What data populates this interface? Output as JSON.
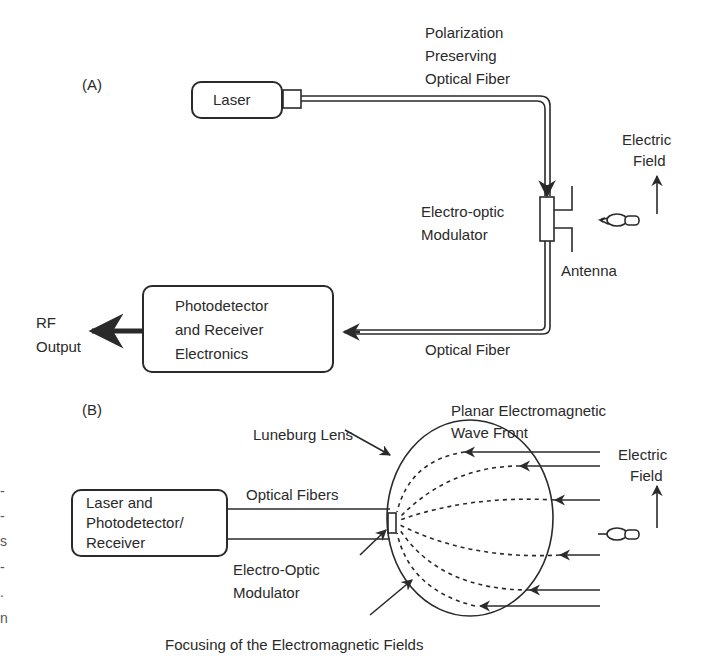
{
  "panel_a": {
    "label": "(A)",
    "laser": "Laser",
    "fiber_top": [
      "Polarization",
      "Preserving",
      "Optical Fiber"
    ],
    "modulator": [
      "Electro-optic",
      "Modulator"
    ],
    "antenna": "Antenna",
    "electric_field": [
      "Electric",
      "Field"
    ],
    "receiver": [
      "Photodetector",
      "and Receiver",
      "Electronics"
    ],
    "rf_output": [
      "RF",
      "Output"
    ],
    "fiber_bottom": "Optical Fiber"
  },
  "panel_b": {
    "label": "(B)",
    "luneburg": "Luneburg Lens",
    "wavefront": [
      "Planar Electromagnetic",
      "Wave Front"
    ],
    "electric_field": [
      "Electric",
      "Field"
    ],
    "transceiver": [
      "Laser and",
      "Photodetector/",
      "Receiver"
    ],
    "fibers": "Optical Fibers",
    "modulator": [
      "Electro-Optic",
      "Modulator"
    ],
    "focusing": "Focusing of the Electromagnetic Fields"
  },
  "clipped_left_fragments": [
    "-",
    "-",
    "s",
    "-",
    ".",
    "n"
  ],
  "colors": {
    "ink": "#2a2a2a",
    "background": "#ffffff"
  }
}
